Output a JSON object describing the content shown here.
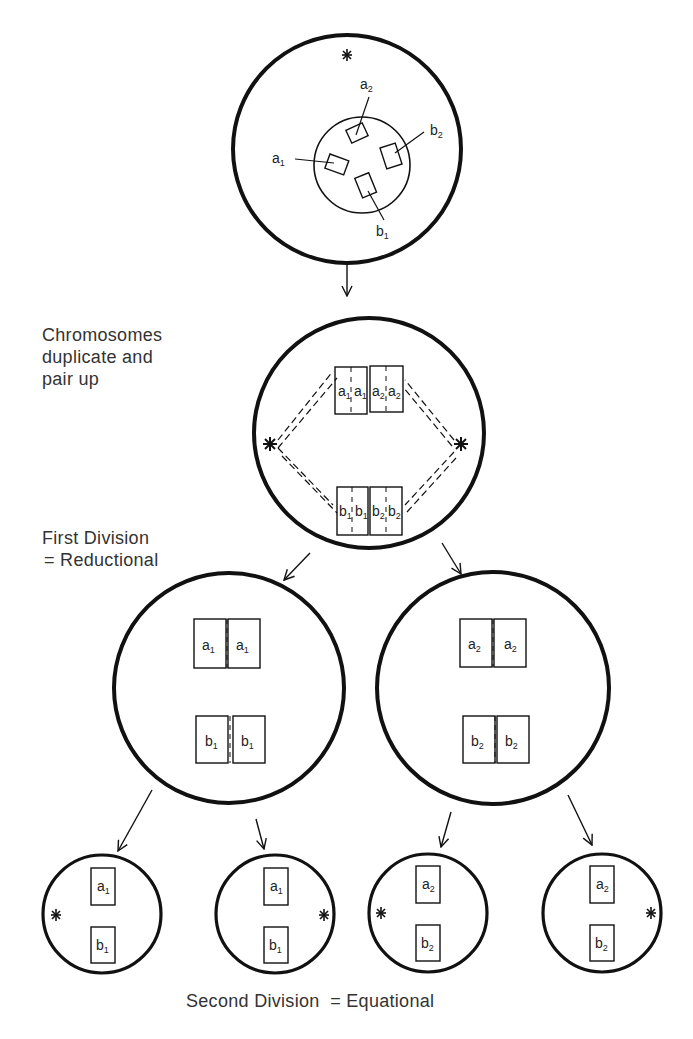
{
  "diagram": {
    "type": "meiosis-chromosome-segregation",
    "colors": {
      "ink": "#111111",
      "text": "#333333",
      "background": "#ffffff"
    }
  },
  "labels": {
    "step1": [
      "Chromosomes",
      "duplicate and",
      "pair up"
    ],
    "step2": [
      "First Division",
      "= Reductional"
    ],
    "step3": "Second Division  = Equational"
  },
  "cells": {
    "parent": {
      "chromosomes": [
        {
          "base": "a",
          "sub": "2"
        },
        {
          "base": "a",
          "sub": "1"
        },
        {
          "base": "b",
          "sub": "2"
        },
        {
          "base": "b",
          "sub": "1"
        }
      ],
      "centrosome": "asterisk-icon"
    },
    "paired": {
      "top_pair": [
        {
          "base": "a",
          "sub": "1"
        },
        {
          "base": "a",
          "sub": "1"
        },
        {
          "base": "a",
          "sub": "2"
        },
        {
          "base": "a",
          "sub": "2"
        }
      ],
      "bottom_pair": [
        {
          "base": "b",
          "sub": "1"
        },
        {
          "base": "b",
          "sub": "1"
        },
        {
          "base": "b",
          "sub": "2"
        },
        {
          "base": "b",
          "sub": "2"
        }
      ]
    },
    "first_division": [
      {
        "top": [
          {
            "base": "a",
            "sub": "1"
          },
          {
            "base": "a",
            "sub": "1"
          }
        ],
        "bottom": [
          {
            "base": "b",
            "sub": "1"
          },
          {
            "base": "b",
            "sub": "1"
          }
        ]
      },
      {
        "top": [
          {
            "base": "a",
            "sub": "2"
          },
          {
            "base": "a",
            "sub": "2"
          }
        ],
        "bottom": [
          {
            "base": "b",
            "sub": "2"
          },
          {
            "base": "b",
            "sub": "2"
          }
        ]
      }
    ],
    "second_division": [
      {
        "top": {
          "base": "a",
          "sub": "1"
        },
        "bottom": {
          "base": "b",
          "sub": "1"
        },
        "centrosome_side": "left"
      },
      {
        "top": {
          "base": "a",
          "sub": "1"
        },
        "bottom": {
          "base": "b",
          "sub": "1"
        },
        "centrosome_side": "right"
      },
      {
        "top": {
          "base": "a",
          "sub": "2"
        },
        "bottom": {
          "base": "b",
          "sub": "2"
        },
        "centrosome_side": "left"
      },
      {
        "top": {
          "base": "a",
          "sub": "2"
        },
        "bottom": {
          "base": "b",
          "sub": "2"
        },
        "centrosome_side": "right"
      }
    ]
  }
}
